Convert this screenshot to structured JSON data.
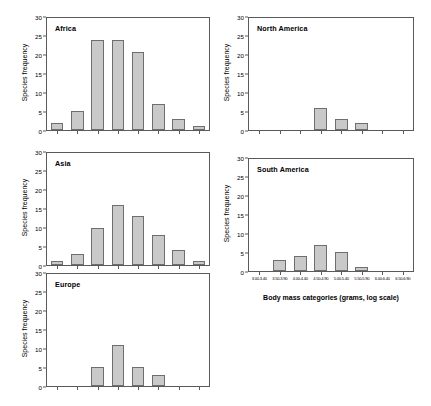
{
  "figure": {
    "y_axis_label": "Species frequency",
    "x_axis_title": "Body mass categories (grams, log scale)",
    "y_ticks": [
      "0",
      "5",
      "10",
      "15",
      "20",
      "25",
      "30"
    ],
    "x_tick_labels": [
      "3.00-3.40",
      "3.50-3.90",
      "4.00-4.40",
      "4.50-4.90",
      "5.00-5.40",
      "5.50-5.90",
      "6.00-6.40",
      "6.50-6.90"
    ],
    "bar_fill_color": "#c9c9c9",
    "bar_border_color": "#6e6e6e",
    "axis_color": "#5a5a5a"
  },
  "panels": [
    {
      "id": "africa",
      "title": "Africa"
    },
    {
      "id": "asia",
      "title": "Asia"
    },
    {
      "id": "europe",
      "title": "Europe"
    },
    {
      "id": "north-america",
      "title": "North America"
    },
    {
      "id": "south-america",
      "title": "South America"
    }
  ],
  "chart_data": [
    {
      "type": "bar",
      "title": "Africa",
      "categories": [
        "3.00-3.40",
        "3.50-3.90",
        "4.00-4.40",
        "4.50-4.90",
        "5.00-5.40",
        "5.50-5.90",
        "6.00-6.40",
        "6.50-6.90"
      ],
      "values": [
        2,
        5,
        24,
        24,
        21,
        7,
        3,
        1
      ],
      "xlabel": "Body mass categories (grams, log scale)",
      "ylabel": "Species frequency",
      "ylim": [
        0,
        30
      ],
      "yticks": [
        0,
        5,
        10,
        15,
        20,
        25,
        30
      ],
      "grid": false,
      "legend": "none"
    },
    {
      "type": "bar",
      "title": "Asia",
      "categories": [
        "3.00-3.40",
        "3.50-3.90",
        "4.00-4.40",
        "4.50-4.90",
        "5.00-5.40",
        "5.50-5.90",
        "6.00-6.40",
        "6.50-6.90"
      ],
      "values": [
        1,
        3,
        10,
        16,
        13,
        8,
        4,
        1
      ],
      "xlabel": "Body mass categories (grams, log scale)",
      "ylabel": "Species frequency",
      "ylim": [
        0,
        30
      ],
      "yticks": [
        0,
        5,
        10,
        15,
        20,
        25,
        30
      ],
      "grid": false,
      "legend": "none"
    },
    {
      "type": "bar",
      "title": "Europe",
      "categories": [
        "3.00-3.40",
        "3.50-3.90",
        "4.00-4.40",
        "4.50-4.90",
        "5.00-5.40",
        "5.50-5.90",
        "6.00-6.40",
        "6.50-6.90"
      ],
      "values": [
        0,
        0,
        5,
        11,
        5,
        3,
        0,
        0
      ],
      "xlabel": "Body mass categories (grams, log scale)",
      "ylabel": "Species frequency",
      "ylim": [
        0,
        30
      ],
      "yticks": [
        0,
        5,
        10,
        15,
        20,
        25,
        30
      ],
      "grid": false,
      "legend": "none"
    },
    {
      "type": "bar",
      "title": "North America",
      "categories": [
        "3.00-3.40",
        "3.50-3.90",
        "4.00-4.40",
        "4.50-4.90",
        "5.00-5.40",
        "5.50-5.90",
        "6.00-6.40",
        "6.50-6.90"
      ],
      "values": [
        0,
        0,
        0,
        6,
        3,
        2,
        0,
        0
      ],
      "xlabel": "Body mass categories (grams, log scale)",
      "ylabel": "Species frequency",
      "ylim": [
        0,
        30
      ],
      "yticks": [
        0,
        5,
        10,
        15,
        20,
        25,
        30
      ],
      "grid": false,
      "legend": "none"
    },
    {
      "type": "bar",
      "title": "South America",
      "categories": [
        "3.00-3.40",
        "3.50-3.90",
        "4.00-4.40",
        "4.50-4.90",
        "5.00-5.40",
        "5.50-5.90",
        "6.00-6.40",
        "6.50-6.90"
      ],
      "values": [
        0,
        3,
        4,
        7,
        5,
        1,
        0,
        0
      ],
      "xlabel": "Body mass categories (grams, log scale)",
      "ylabel": "Species frequency",
      "ylim": [
        0,
        30
      ],
      "yticks": [
        0,
        5,
        10,
        15,
        20,
        25,
        30
      ],
      "grid": false,
      "legend": "none"
    }
  ]
}
